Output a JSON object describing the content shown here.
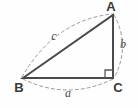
{
  "figure": {
    "name": "right-triangle-abc",
    "background_color": "#fefefe",
    "solid_stroke_color": "#4a4a4a",
    "dashed_stroke_color": "#9a9a9a",
    "label_color": "#3a3a3a",
    "side_label_color": "#4a4a4a",
    "solid_stroke_width": 2,
    "dashed_stroke_width": 1,
    "dash_pattern": "3,3"
  },
  "vertices": [
    {
      "id": "A",
      "label": "A",
      "x": 113,
      "y": 15,
      "label_x": 111,
      "label_y": 7
    },
    {
      "id": "B",
      "label": "B",
      "x": 23,
      "y": 78,
      "label_x": 19,
      "label_y": 88
    },
    {
      "id": "C",
      "label": "C",
      "x": 113,
      "y": 78,
      "label_x": 117,
      "label_y": 88
    }
  ],
  "sides": [
    {
      "id": "a",
      "label": "a",
      "from": "B",
      "to": "C",
      "label_x": 68,
      "label_y": 93,
      "type": "leg",
      "note": "base, horizontal"
    },
    {
      "id": "b",
      "label": "b",
      "from": "A",
      "to": "C",
      "label_x": 122,
      "label_y": 45,
      "type": "leg",
      "note": "vertical right side"
    },
    {
      "id": "c",
      "label": "c",
      "from": "B",
      "to": "A",
      "label_x": 54,
      "label_y": 37,
      "type": "hypotenuse",
      "note": "diagonal"
    }
  ],
  "right_angle": {
    "at_vertex": "C",
    "marker": "square",
    "size": 8,
    "name": "right-angle-marker"
  },
  "arcs": [
    {
      "id": "arc-a",
      "for_side": "a",
      "path": "M 23 79 Q 68 101 113 79",
      "style": "dashed"
    },
    {
      "id": "arc-b",
      "for_side": "b",
      "path": "M 114 15 Q 131 46 114 78",
      "style": "dashed"
    },
    {
      "id": "arc-c",
      "for_side": "c",
      "path": "M 22 77 Q 55 20 112 14",
      "style": "dashed"
    }
  ],
  "triangle_path": "M 23 78 L 113 15 L 113 78 Z"
}
